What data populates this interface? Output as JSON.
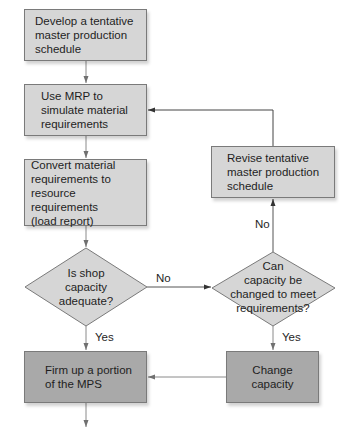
{
  "flowchart": {
    "nodes": {
      "develop_mps": {
        "type": "process",
        "text": "Develop a tentative\nmaster production\nschedule"
      },
      "use_mrp": {
        "type": "process",
        "text": "Use MRP to\nsimulate material\nrequirements"
      },
      "convert_requirements": {
        "type": "process",
        "text": "Convert material\nrequirements to\nresource requirements\n(load report)"
      },
      "is_capacity_adequate": {
        "type": "decision",
        "text": "Is shop\ncapacity\nadequate?"
      },
      "can_capacity_change": {
        "type": "decision",
        "text": "Can\ncapacity be\nchanged to meet\nrequirements?"
      },
      "revise_mps": {
        "type": "process",
        "text": "Revise tentative\nmaster production\nschedule"
      },
      "firm_up_mps": {
        "type": "process",
        "text": "Firm up a portion\nof the MPS"
      },
      "change_capacity": {
        "type": "process",
        "text": "Change\ncapacity"
      }
    },
    "edge_labels": {
      "adequate_no": "No",
      "adequate_yes": "Yes",
      "change_no": "No",
      "change_yes": "Yes"
    },
    "edges": [
      {
        "from": "develop_mps",
        "to": "use_mrp"
      },
      {
        "from": "use_mrp",
        "to": "convert_requirements"
      },
      {
        "from": "convert_requirements",
        "to": "is_capacity_adequate"
      },
      {
        "from": "is_capacity_adequate",
        "to": "can_capacity_change",
        "label": "No"
      },
      {
        "from": "is_capacity_adequate",
        "to": "firm_up_mps",
        "label": "Yes"
      },
      {
        "from": "can_capacity_change",
        "to": "revise_mps",
        "label": "No"
      },
      {
        "from": "can_capacity_change",
        "to": "change_capacity",
        "label": "Yes"
      },
      {
        "from": "revise_mps",
        "to": "use_mrp"
      },
      {
        "from": "change_capacity",
        "to": "firm_up_mps"
      }
    ],
    "colors": {
      "light_box": "#d6d6d6",
      "dark_box": "#a9a9a9",
      "line": "#707070",
      "text": "#1e1e1e"
    }
  }
}
